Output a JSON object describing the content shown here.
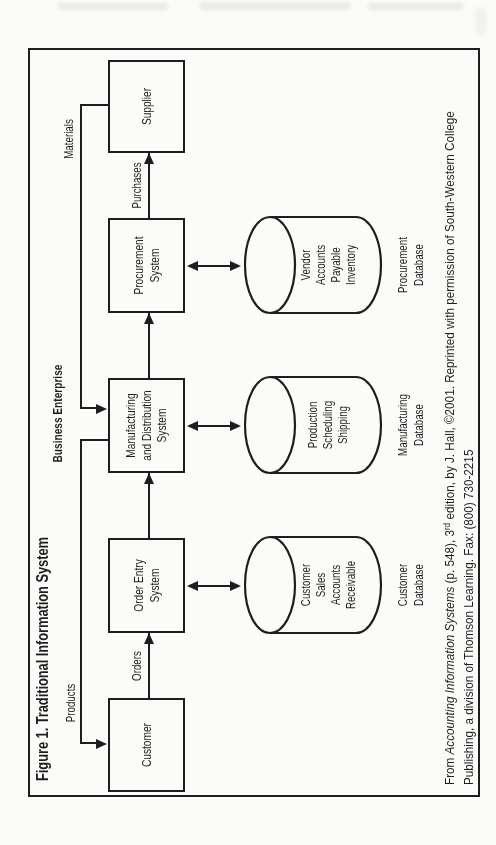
{
  "figure": {
    "title": "Figure 1. Traditional Information System",
    "enterprise_label": "Business Enterprise",
    "nodes": [
      {
        "id": "customer",
        "label": "Customer"
      },
      {
        "id": "order-entry",
        "label": "Order Entry\nSystem"
      },
      {
        "id": "manufacturing",
        "label": "Manufacturing\nand Distribution\nSystem"
      },
      {
        "id": "procurement",
        "label": "Procurement\nSystem"
      },
      {
        "id": "supplier",
        "label": "Supplier"
      }
    ],
    "flows": {
      "orders": "Orders",
      "purchases": "Purchases",
      "products": "Products",
      "materials": "Materials"
    },
    "databases": [
      {
        "contents": "Customer\nSales\nAccounts\nReceivable",
        "name": "Customer\nDatabase"
      },
      {
        "contents": "Production\nScheduling\nShipping",
        "name": "Manufacturing\nDatabase"
      },
      {
        "contents": "Vendor\nAccounts\nPayable\nInventory",
        "name": "Procurement\nDatabase"
      }
    ],
    "citation": {
      "prefix": "From ",
      "book_title": "Accounting Information Systems",
      "middle": " (p. 548), 3",
      "ordinal_suffix": "rd",
      "rest": " edition, by J. Hall, ©2001. Reprinted with permission of South-Western College",
      "line2": "Publishing, a division of Thomson Learning. Fax: (800) 730-2215"
    },
    "colors": {
      "ink": "#1e1e1e",
      "paper": "#fbfbf9"
    }
  }
}
